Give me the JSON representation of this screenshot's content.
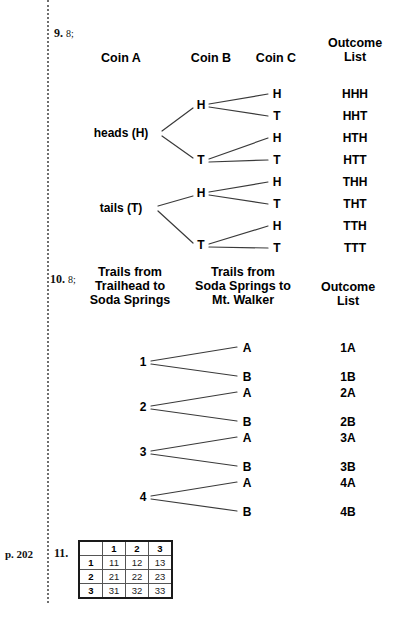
{
  "page": {
    "page_ref": "p. 202",
    "width": 410,
    "height": 619
  },
  "problem9": {
    "number": "9.",
    "answer": "8;",
    "headers": [
      {
        "label": "Coin A",
        "x": 121,
        "y": 58
      },
      {
        "label": "Coin B",
        "x": 211,
        "y": 58
      },
      {
        "label": "Coin C",
        "x": 276,
        "y": 58
      },
      {
        "label": "Outcome\nList",
        "x": 355,
        "y": 43
      }
    ],
    "level1": [
      {
        "label": "heads (H)",
        "x": 121,
        "y": 133
      },
      {
        "label": "tails (T)",
        "x": 121,
        "y": 208
      }
    ],
    "level2": [
      {
        "label": "H",
        "x": 201,
        "y": 105
      },
      {
        "label": "T",
        "x": 201,
        "y": 160
      },
      {
        "label": "H",
        "x": 201,
        "y": 193
      },
      {
        "label": "T",
        "x": 201,
        "y": 245
      }
    ],
    "level3": [
      {
        "label": "H",
        "x": 277,
        "y": 94
      },
      {
        "label": "T",
        "x": 277,
        "y": 116
      },
      {
        "label": "H",
        "x": 277,
        "y": 138
      },
      {
        "label": "T",
        "x": 277,
        "y": 160
      },
      {
        "label": "H",
        "x": 277,
        "y": 182
      },
      {
        "label": "T",
        "x": 277,
        "y": 204
      },
      {
        "label": "H",
        "x": 277,
        "y": 226
      },
      {
        "label": "T",
        "x": 277,
        "y": 248
      }
    ],
    "outcomes": [
      {
        "label": "HHH",
        "x": 355,
        "y": 94
      },
      {
        "label": "HHT",
        "x": 355,
        "y": 116
      },
      {
        "label": "HTH",
        "x": 355,
        "y": 138
      },
      {
        "label": "HTT",
        "x": 355,
        "y": 160
      },
      {
        "label": "THH",
        "x": 355,
        "y": 182
      },
      {
        "label": "THT",
        "x": 355,
        "y": 204
      },
      {
        "label": "TTH",
        "x": 355,
        "y": 226
      },
      {
        "label": "TTT",
        "x": 355,
        "y": 248
      }
    ]
  },
  "problem10": {
    "number": "10.",
    "answer": "8;",
    "headers": [
      {
        "label": "Trails from\nTrailhead to\nSoda Springs",
        "x": 130,
        "y": 272
      },
      {
        "label": "Trails from\nSoda Springs to\nMt. Walker",
        "x": 243,
        "y": 272
      },
      {
        "label": "Outcome\nList",
        "x": 348,
        "y": 287
      }
    ],
    "level1": [
      {
        "label": "1",
        "x": 143,
        "y": 362
      },
      {
        "label": "2",
        "x": 143,
        "y": 407
      },
      {
        "label": "3",
        "x": 143,
        "y": 452
      },
      {
        "label": "4",
        "x": 143,
        "y": 497
      }
    ],
    "level2": [
      {
        "label": "A",
        "x": 247,
        "y": 348
      },
      {
        "label": "B",
        "x": 247,
        "y": 377
      },
      {
        "label": "A",
        "x": 247,
        "y": 393
      },
      {
        "label": "B",
        "x": 247,
        "y": 422
      },
      {
        "label": "A",
        "x": 247,
        "y": 438
      },
      {
        "label": "B",
        "x": 247,
        "y": 467
      },
      {
        "label": "A",
        "x": 247,
        "y": 483
      },
      {
        "label": "B",
        "x": 247,
        "y": 512
      }
    ],
    "outcomes": [
      {
        "label": "1A",
        "x": 348,
        "y": 348
      },
      {
        "label": "1B",
        "x": 348,
        "y": 377
      },
      {
        "label": "2A",
        "x": 348,
        "y": 393
      },
      {
        "label": "2B",
        "x": 348,
        "y": 422
      },
      {
        "label": "3A",
        "x": 348,
        "y": 438
      },
      {
        "label": "3B",
        "x": 348,
        "y": 467
      },
      {
        "label": "4A",
        "x": 348,
        "y": 483
      },
      {
        "label": "4B",
        "x": 348,
        "y": 512
      }
    ]
  },
  "problem11": {
    "number": "11.",
    "table": {
      "corner": "",
      "col_headers": [
        "1",
        "2",
        "3"
      ],
      "row_headers": [
        "1",
        "2",
        "3"
      ],
      "cells": [
        [
          "11",
          "12",
          "13"
        ],
        [
          "21",
          "22",
          "23"
        ],
        [
          "31",
          "32",
          "33"
        ]
      ]
    }
  },
  "colors": {
    "ink": "#000000",
    "rule": "#6f6f6f",
    "line": "#3a3a3a"
  }
}
